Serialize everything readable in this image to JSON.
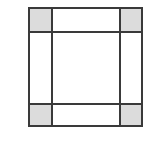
{
  "figure": {
    "name": "nine-patch-grid",
    "type": "diagram",
    "background_color": "#ffffff",
    "line_color": "#3a3a3a",
    "line_width": 2,
    "fill_shaded": "#dcdcdc",
    "fill_plain": "#ffffff",
    "frame": {
      "x": 28,
      "y": 7,
      "width": 115,
      "height": 120
    },
    "columns": [
      {
        "id": "col-left",
        "x": 0,
        "width": 24
      },
      {
        "id": "col-center",
        "x": 24,
        "width": 68
      },
      {
        "id": "col-right",
        "x": 92,
        "width": 23
      }
    ],
    "rows": [
      {
        "id": "row-top",
        "y": 0,
        "height": 25
      },
      {
        "id": "row-middle",
        "y": 25,
        "height": 72
      },
      {
        "id": "row-bottom",
        "y": 97,
        "height": 23
      }
    ],
    "cells": [
      {
        "id": "cell-top-left",
        "row": 0,
        "col": 0,
        "shaded": true,
        "fill": "#dcdcdc"
      },
      {
        "id": "cell-top-center",
        "row": 0,
        "col": 1,
        "shaded": false,
        "fill": "#ffffff"
      },
      {
        "id": "cell-top-right",
        "row": 0,
        "col": 2,
        "shaded": true,
        "fill": "#dcdcdc"
      },
      {
        "id": "cell-middle-left",
        "row": 1,
        "col": 0,
        "shaded": false,
        "fill": "#ffffff"
      },
      {
        "id": "cell-middle-center",
        "row": 1,
        "col": 1,
        "shaded": false,
        "fill": "#ffffff"
      },
      {
        "id": "cell-middle-right",
        "row": 1,
        "col": 2,
        "shaded": false,
        "fill": "#ffffff"
      },
      {
        "id": "cell-bottom-left",
        "row": 2,
        "col": 0,
        "shaded": true,
        "fill": "#dcdcdc"
      },
      {
        "id": "cell-bottom-center",
        "row": 2,
        "col": 1,
        "shaded": false,
        "fill": "#ffffff"
      },
      {
        "id": "cell-bottom-right",
        "row": 2,
        "col": 2,
        "shaded": true,
        "fill": "#dcdcdc"
      }
    ],
    "gridlines": {
      "vertical": [
        24,
        92
      ],
      "horizontal": [
        25,
        97
      ]
    },
    "labels": []
  }
}
